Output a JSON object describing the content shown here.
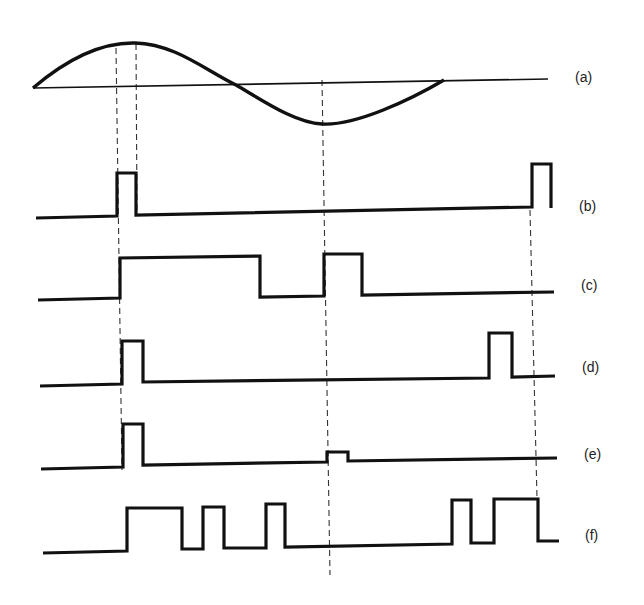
{
  "figure": {
    "type": "timing-diagram",
    "traces": [
      {
        "id": "a",
        "label": "(a)",
        "kind": "sine-with-axis",
        "description": "one cycle of a sine wave over a horizontal reference line"
      },
      {
        "id": "b",
        "label": "(b)",
        "kind": "pulse-train"
      },
      {
        "id": "c",
        "label": "(c)",
        "kind": "pulse-train"
      },
      {
        "id": "d",
        "label": "(d)",
        "kind": "pulse-train"
      },
      {
        "id": "e",
        "label": "(e)",
        "kind": "pulse-train"
      },
      {
        "id": "f",
        "label": "(f)",
        "kind": "pulse-train"
      }
    ],
    "guide_lines": "dashed vertical reference lines aligning transitions across traces",
    "colors": {
      "ink": "#111111",
      "background": "#ffffff"
    }
  }
}
